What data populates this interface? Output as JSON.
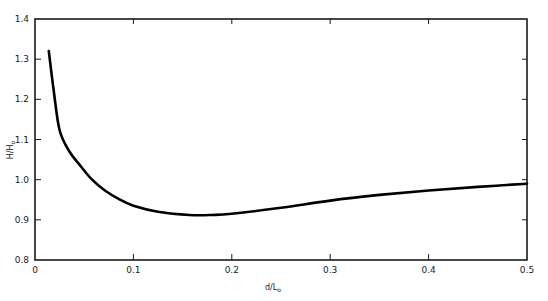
{
  "chart_data": {
    "type": "line",
    "title": "",
    "xlabel": "d/L",
    "xlabel_sub": "o",
    "ylabel": "H/H",
    "ylabel_sub": "o",
    "xlim": [
      0,
      0.5
    ],
    "ylim": [
      0.8,
      1.4
    ],
    "grid": false,
    "legend": null,
    "x_ticks": [
      0,
      0.1,
      0.2,
      0.3,
      0.4,
      0.5
    ],
    "x_tick_labels": [
      "0",
      "0.1",
      "0.2",
      "0.3",
      "0.4",
      "0.5"
    ],
    "y_ticks": [
      0.8,
      0.9,
      1.0,
      1.1,
      1.2,
      1.3,
      1.4
    ],
    "y_tick_labels": [
      "0.8",
      "0.9",
      "1.0",
      "1.1",
      "1.2",
      "1.3",
      "1.4"
    ],
    "series": [
      {
        "name": "H/Ho",
        "x": [
          0.014,
          0.019,
          0.025,
          0.035,
          0.046,
          0.058,
          0.071,
          0.085,
          0.1,
          0.125,
          0.157,
          0.18,
          0.2,
          0.25,
          0.3,
          0.35,
          0.4,
          0.45,
          0.5
        ],
        "y": [
          1.32,
          1.222,
          1.123,
          1.07,
          1.035,
          1.0,
          0.973,
          0.952,
          0.935,
          0.92,
          0.912,
          0.912,
          0.915,
          0.93,
          0.948,
          0.962,
          0.973,
          0.982,
          0.99
        ]
      }
    ]
  },
  "axes": {
    "x_label": "d/L",
    "x_label_sub": "o",
    "y_label": "H/H",
    "y_label_sub": "o"
  },
  "style": {
    "line_color": "#000000",
    "axis_color": "#1a1a1a",
    "background": "#ffffff"
  }
}
